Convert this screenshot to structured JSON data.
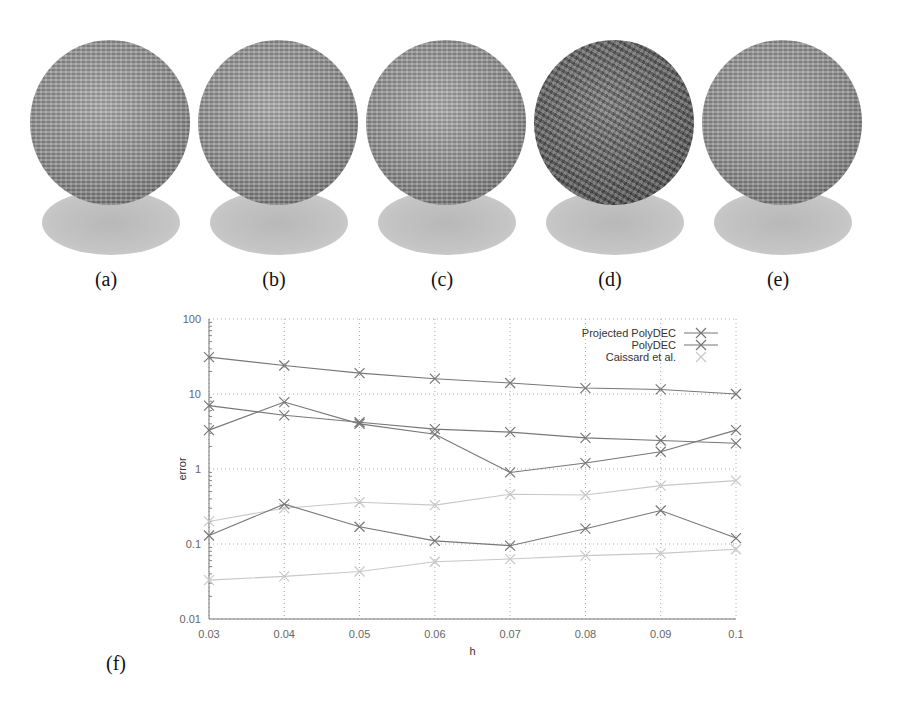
{
  "figure": {
    "subfigures": [
      {
        "label": "(a)",
        "kind": "rendered-sphere"
      },
      {
        "label": "(b)",
        "kind": "rendered-sphere"
      },
      {
        "label": "(c)",
        "kind": "rendered-sphere"
      },
      {
        "label": "(d)",
        "kind": "rendered-sphere-noisy"
      },
      {
        "label": "(e)",
        "kind": "rendered-sphere"
      }
    ],
    "chart_label": "(f)"
  },
  "chart_data": {
    "type": "line",
    "title": "",
    "xlabel": "h",
    "ylabel": "error",
    "yscale": "log",
    "ylim": [
      0.01,
      100
    ],
    "xlim": [
      0.03,
      0.1
    ],
    "grid": true,
    "legend_position": "top-right",
    "x": [
      0.03,
      0.04,
      0.05,
      0.06,
      0.07,
      0.08,
      0.09,
      0.1
    ],
    "x_tick_labels": [
      "0.03",
      "0.04",
      "0.05",
      "0.06",
      "0.07",
      "0.08",
      "0.09",
      "0.1"
    ],
    "y_tick_labels": [
      "0.01",
      "0.1",
      "1",
      "10",
      "100"
    ],
    "legend": [
      "Projected PolyDEC",
      "PolyDEC",
      "Caissard et al."
    ],
    "series": [
      {
        "name": "Projected PolyDEC (a)",
        "color": "#777777",
        "values": [
          31,
          24,
          19,
          16,
          14,
          12,
          11.5,
          10
        ]
      },
      {
        "name": "PolyDEC (a)",
        "color": "#777777",
        "values": [
          7,
          5.2,
          4.2,
          3.4,
          3.1,
          2.6,
          2.4,
          2.2
        ]
      },
      {
        "name": "Projected PolyDEC (b)",
        "color": "#777777",
        "values": [
          3.3,
          7.8,
          4.0,
          2.9,
          0.9,
          1.2,
          1.7,
          3.3
        ]
      },
      {
        "name": "Caissard et al. (a)",
        "color": "#c8c8c8",
        "values": [
          0.2,
          0.3,
          0.36,
          0.33,
          0.46,
          0.45,
          0.6,
          0.7
        ]
      },
      {
        "name": "PolyDEC (b)",
        "color": "#777777",
        "values": [
          0.13,
          0.34,
          0.17,
          0.11,
          0.095,
          0.16,
          0.28,
          0.12
        ]
      },
      {
        "name": "Caissard et al. (b)",
        "color": "#c8c8c8",
        "values": [
          0.033,
          0.037,
          0.043,
          0.058,
          0.063,
          0.07,
          0.075,
          0.085
        ]
      }
    ]
  }
}
